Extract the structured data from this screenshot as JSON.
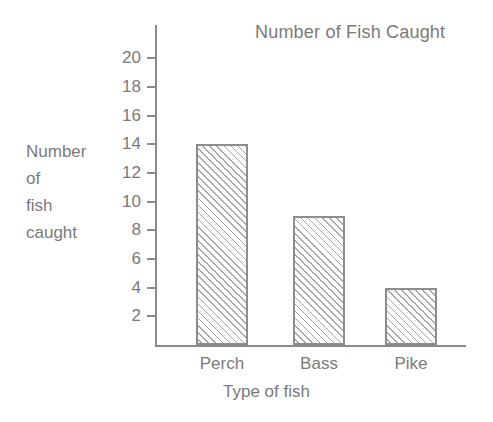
{
  "chart_data": {
    "type": "bar",
    "title": "Number of Fish Caught",
    "xlabel": "Type of fish",
    "ylabel": "Number of fish caught",
    "ylabel_lines": [
      "Number",
      "of",
      "fish",
      "caught"
    ],
    "categories": [
      "Perch",
      "Bass",
      "Pike"
    ],
    "values": [
      14,
      9,
      4
    ],
    "ylim": [
      0,
      21
    ],
    "yticks": [
      2,
      4,
      6,
      8,
      10,
      12,
      14,
      16,
      18,
      20
    ],
    "ytick_labels": [
      "2",
      "4",
      "6",
      "8",
      "10",
      "12",
      "14",
      "16",
      "18",
      "20"
    ],
    "grid": false,
    "legend": "none",
    "series": [
      {
        "name": "Fish caught",
        "values": [
          14,
          9,
          4
        ]
      }
    ],
    "bar_fill": "diagonal-hatch",
    "colors": {
      "axis": "#8a8a8a",
      "text": "#7a7a7a",
      "bar_border": "#8d8d8d",
      "bar_hatch": "#a8a8a8",
      "background": "#ffffff"
    }
  }
}
